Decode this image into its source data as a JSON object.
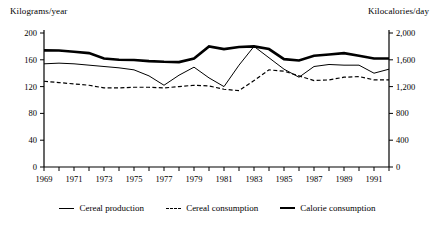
{
  "chart_data": {
    "type": "line",
    "title": "",
    "xlabel": "",
    "ylabel": "Kilograms/year",
    "ylabel_right": "Kilocalories/day",
    "grid": false,
    "legend_position": "bottom",
    "x": [
      1969,
      1970,
      1971,
      1972,
      1973,
      1974,
      1975,
      1976,
      1977,
      1978,
      1979,
      1980,
      1981,
      1982,
      1983,
      1984,
      1985,
      1986,
      1987,
      1988,
      1989,
      1990,
      1991,
      1992
    ],
    "xticks": [
      "1969",
      "1971",
      "1973",
      "1975",
      "1977",
      "1979",
      "1981",
      "1983",
      "1985",
      "1987",
      "1989",
      "1991"
    ],
    "yticks_left": [
      "0",
      "40",
      "80",
      "120",
      "160",
      "200"
    ],
    "yticks_right": [
      "0",
      "400",
      "800",
      "1,200",
      "1,600",
      "2,000"
    ],
    "ylim": [
      0,
      200
    ],
    "ylim_right": [
      0,
      2000
    ],
    "series": [
      {
        "name": "Cereal production",
        "axis": "left",
        "style": "thin-solid",
        "values": [
          154,
          155,
          154,
          152,
          150,
          148,
          145,
          136,
          122,
          137,
          149,
          133,
          120,
          152,
          180,
          163,
          146,
          134,
          150,
          153,
          152,
          152,
          140,
          146
        ]
      },
      {
        "name": "Cereal consumption",
        "axis": "left",
        "style": "dashed",
        "values": [
          128,
          126,
          124,
          122,
          118,
          118,
          119,
          119,
          118,
          120,
          122,
          121,
          116,
          114,
          129,
          145,
          143,
          136,
          129,
          130,
          134,
          135,
          130,
          130
        ]
      },
      {
        "name": "Calorie consumption",
        "axis": "right",
        "style": "thick-solid",
        "values": [
          1740,
          1738,
          1720,
          1700,
          1618,
          1600,
          1598,
          1580,
          1570,
          1566,
          1620,
          1800,
          1760,
          1790,
          1800,
          1760,
          1610,
          1590,
          1660,
          1680,
          1700,
          1660,
          1620,
          1620
        ]
      }
    ]
  },
  "legend": {
    "items": [
      {
        "label": "Cereal production",
        "marker": "line-solid-thin"
      },
      {
        "label": "Cereal consumption",
        "marker": "line-dashed"
      },
      {
        "label": "Calorie consumption",
        "marker": "line-solid-thick"
      }
    ]
  }
}
